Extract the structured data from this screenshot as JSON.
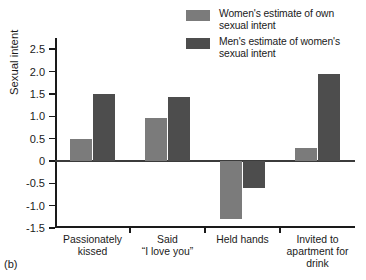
{
  "panel_tag": "(b)",
  "legend": {
    "position": "top-right",
    "entries": [
      {
        "label": "Women's estimate of own\nsexual intent",
        "color": "#7b7b7b",
        "swatch_name": "legend-swatch-women"
      },
      {
        "label": "Men's estimate of women's\nsexual intent",
        "color": "#4d4d4d",
        "swatch_name": "legend-swatch-men"
      }
    ]
  },
  "chart_data": {
    "type": "bar",
    "title": "",
    "subtitle": "",
    "xlabel": "",
    "ylabel": "Sexual intent",
    "categories": [
      "Passionately\nkissed",
      "Said\n“I love you”",
      "Held hands",
      "Invited to\napartment for\ndrink"
    ],
    "series": [
      {
        "name": "Women's estimate of own sexual intent",
        "color": "#7b7b7b",
        "values": [
          0.5,
          0.97,
          -1.3,
          0.28
        ]
      },
      {
        "name": "Men's estimate of women's sexual intent",
        "color": "#4d4d4d",
        "values": [
          1.49,
          1.42,
          -0.6,
          1.95
        ]
      }
    ],
    "ylim": [
      -1.5,
      2.75
    ],
    "yticks": [
      2.5,
      2.0,
      1.5,
      1.0,
      0.5,
      0,
      -0.5,
      -1.0,
      -1.5
    ],
    "ytick_labels": [
      "2.5",
      "2.0",
      "1.5",
      "1.0",
      "0.5",
      "0",
      "-0.5",
      "-1.0",
      "-1.5"
    ],
    "grid": false,
    "zero_line": true,
    "legend_position": "top-right"
  }
}
